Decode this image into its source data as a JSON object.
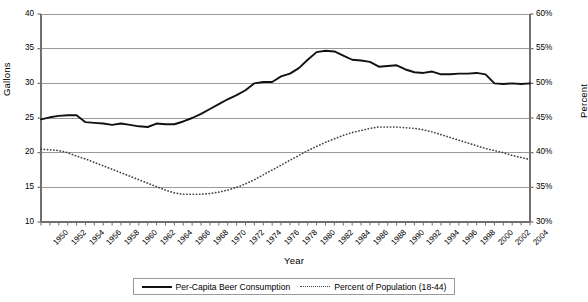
{
  "chart_data": {
    "type": "line",
    "title": "",
    "xlabel": "Year",
    "ylabel": "Gallons",
    "y2label": "Percent",
    "grid": true,
    "legend_position": "bottom",
    "xlim": [
      1950,
      2005
    ],
    "ylim": [
      10,
      40
    ],
    "y2lim": [
      30,
      60
    ],
    "y_ticks": [
      "10",
      "15",
      "20",
      "25",
      "30",
      "35",
      "40"
    ],
    "y_tick_values": [
      10,
      15,
      20,
      25,
      30,
      35,
      40
    ],
    "y2_ticks": [
      "30%",
      "35%",
      "40%",
      "45%",
      "50%",
      "55%",
      "60%"
    ],
    "y2_tick_values": [
      30,
      35,
      40,
      45,
      50,
      55,
      60
    ],
    "x_tick_labels": [
      "1950",
      "1952",
      "1954",
      "1956",
      "1958",
      "1960",
      "1962",
      "1964",
      "1966",
      "1968",
      "1970",
      "1972",
      "1974",
      "1976",
      "1978",
      "1980",
      "1982",
      "1984",
      "1986",
      "1988",
      "1990",
      "1992",
      "1994",
      "1996",
      "1998",
      "2000",
      "2002",
      "2004"
    ],
    "x": [
      1950,
      1951,
      1952,
      1953,
      1954,
      1955,
      1956,
      1957,
      1958,
      1959,
      1960,
      1961,
      1962,
      1963,
      1964,
      1965,
      1966,
      1967,
      1968,
      1969,
      1970,
      1971,
      1972,
      1973,
      1974,
      1975,
      1976,
      1977,
      1978,
      1979,
      1980,
      1981,
      1982,
      1983,
      1984,
      1985,
      1986,
      1987,
      1988,
      1989,
      1990,
      1991,
      1992,
      1993,
      1994,
      1995,
      1996,
      1997,
      1998,
      1999,
      2000,
      2001,
      2002,
      2003,
      2004,
      2005
    ],
    "series": [
      {
        "name": "Per-Capita Beer Consumption",
        "axis": "left",
        "style": "solid",
        "color": "#111111",
        "units": "Gallons",
        "values": [
          24.8,
          25.1,
          25.3,
          25.4,
          25.4,
          24.4,
          24.3,
          24.2,
          24.0,
          24.2,
          24.0,
          23.8,
          23.7,
          24.2,
          24.1,
          24.1,
          24.5,
          25.0,
          25.6,
          26.3,
          27.0,
          27.7,
          28.3,
          29.0,
          30.0,
          30.2,
          30.2,
          31.0,
          31.4,
          32.2,
          33.4,
          34.5,
          34.7,
          34.6,
          34.0,
          33.4,
          33.3,
          33.1,
          32.4,
          32.5,
          32.6,
          32.0,
          31.6,
          31.5,
          31.7,
          31.3,
          31.3,
          31.4,
          31.4,
          31.5,
          31.3,
          30.0,
          29.9,
          30.0,
          29.9,
          30.0
        ]
      },
      {
        "name": "Percent of Population (18-44)",
        "axis": "right",
        "style": "dotted",
        "color": "#444444",
        "units": "Percent",
        "values": [
          40.5,
          40.4,
          40.3,
          40.0,
          39.5,
          39.1,
          38.6,
          38.1,
          37.6,
          37.1,
          36.6,
          36.1,
          35.6,
          35.1,
          34.6,
          34.2,
          34.0,
          34.0,
          34.0,
          34.1,
          34.3,
          34.6,
          35.0,
          35.5,
          36.1,
          36.8,
          37.5,
          38.2,
          38.9,
          39.6,
          40.3,
          40.9,
          41.5,
          42.0,
          42.5,
          42.9,
          43.2,
          43.5,
          43.7,
          43.7,
          43.7,
          43.6,
          43.5,
          43.3,
          43.0,
          42.6,
          42.2,
          41.8,
          41.4,
          41.0,
          40.6,
          40.3,
          40.0,
          39.6,
          39.3,
          39.0
        ]
      }
    ]
  },
  "legend": {
    "entries": [
      {
        "label": "Per-Capita Beer Consumption",
        "style": "solid"
      },
      {
        "label": "Percent of Population (18-44)",
        "style": "dotted"
      }
    ]
  },
  "colors": {
    "series_solid": "#111111",
    "series_dotted": "#444444",
    "grid": "#9a9a9a",
    "axis": "#6f6f6f",
    "background": "#ffffff"
  }
}
